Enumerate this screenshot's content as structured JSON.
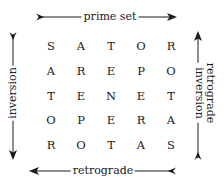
{
  "labels": {
    "top": "prime set",
    "bottom": "retrograde",
    "left": "inversion",
    "right_line1": "retrograde",
    "right_line2": "inversion"
  },
  "grid": {
    "rows": [
      [
        "S",
        "A",
        "T",
        "O",
        "R"
      ],
      [
        "A",
        "R",
        "E",
        "P",
        "O"
      ],
      [
        "T",
        "E",
        "N",
        "E",
        "T"
      ],
      [
        "O",
        "P",
        "E",
        "R",
        "A"
      ],
      [
        "R",
        "O",
        "T",
        "A",
        "S"
      ]
    ]
  },
  "arrows": {
    "top": "right",
    "bottom": "left",
    "left": "down",
    "right": "up"
  },
  "colors": {
    "ink": "#1a1a1a",
    "background": "#ffffff"
  }
}
